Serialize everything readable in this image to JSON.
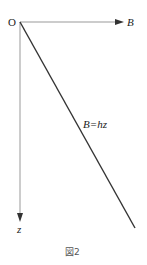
{
  "diagram": {
    "origin_label": "O",
    "x_axis_label": "B",
    "y_axis_label": "z",
    "line_label": "B=hz",
    "caption": "図2",
    "colors": {
      "axis": "#999999",
      "line": "#333333",
      "text": "#222222",
      "caption": "#555555"
    }
  }
}
